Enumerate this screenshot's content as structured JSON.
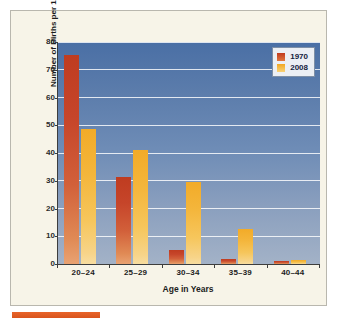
{
  "chart_data": {
    "type": "bar",
    "title": "",
    "xlabel": "Age in Years",
    "ylabel": "Number of Births per 1,000 Women",
    "categories": [
      "20–24",
      "25–29",
      "30–34",
      "35–39",
      "40–44"
    ],
    "series": [
      {
        "name": "1970",
        "color": "#c0391e",
        "values": [
          75.5,
          31.5,
          5.0,
          1.8,
          1.0
        ]
      },
      {
        "name": "2008",
        "color": "#f2a722",
        "values": [
          48.5,
          41.0,
          29.5,
          12.7,
          1.5
        ]
      }
    ],
    "ylim": [
      0,
      80
    ],
    "yticks": [
      0,
      10,
      20,
      30,
      40,
      50,
      60,
      70,
      80
    ],
    "ytick_labels": [
      "0",
      "10",
      "20",
      "30",
      "40",
      "50",
      "60",
      "70",
      "80"
    ],
    "grid": true,
    "legend_position": "top-right",
    "plot_background": "#5b7cab",
    "gridline_color": "#ffffff",
    "page_background": "#f7f4e8",
    "accent_rule_color": "#e8642a"
  },
  "legend": {
    "entries": [
      {
        "label": "1970",
        "swatch": "legend-swatch-1970"
      },
      {
        "label": "2008",
        "swatch": "legend-swatch-2008"
      }
    ]
  }
}
